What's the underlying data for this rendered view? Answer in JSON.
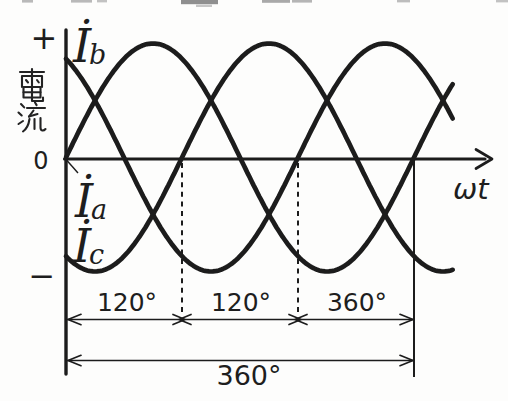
{
  "figure": {
    "type_note": "three-phase current waveform diagram"
  },
  "chart_data": {
    "type": "line",
    "title": "",
    "x_axis_label": "ωt",
    "y_axis_label": "電流",
    "y_axis_positive_label": "+",
    "y_axis_negative_label": "−",
    "origin_label": "0",
    "x_unit": "degrees",
    "x_plot_range_deg": [
      0,
      400
    ],
    "x_marked_range_deg": [
      0,
      360
    ],
    "amplitude": 1,
    "ylim": [
      -1,
      1
    ],
    "grid": false,
    "formula": "i(ωt) = sin(ωt + phase_deg)",
    "series": [
      {
        "key": "a",
        "label_symbol": "İ",
        "label_sub": "a",
        "phase_deg": 0
      },
      {
        "key": "b",
        "label_symbol": "İ",
        "label_sub": "b",
        "phase_deg": 120
      },
      {
        "key": "c",
        "label_symbol": "İ",
        "label_sub": "c",
        "phase_deg": -120
      }
    ],
    "phase_markers_deg": [
      120,
      240
    ],
    "cycle_marker_deg": 360,
    "segment_labels": [
      "120°",
      "120°",
      "120°"
    ],
    "total_label": "360°"
  }
}
